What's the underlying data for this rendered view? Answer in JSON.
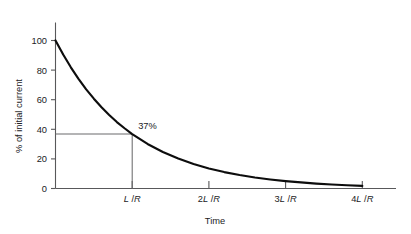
{
  "chart_data": {
    "type": "line",
    "title": "",
    "subtitle": "",
    "xlabel": "Time",
    "ylabel": "% of initial current",
    "xlim": [
      0,
      4.45
    ],
    "ylim": [
      0,
      107
    ],
    "grid": false,
    "legend": null,
    "x_tick_values": [
      1,
      2,
      3,
      4
    ],
    "x_tick_labels": [
      "L /R",
      "2L /R",
      "3L /R",
      "4L /R"
    ],
    "x_ticks": [
      {
        "value": 1,
        "prefix": "",
        "numer": "L",
        "slash": " /",
        "denom": "R"
      },
      {
        "value": 2,
        "prefix": "2",
        "numer": "L",
        "slash": " /",
        "denom": "R"
      },
      {
        "value": 3,
        "prefix": "3",
        "numer": "L",
        "slash": " /",
        "denom": "R"
      },
      {
        "value": 4,
        "prefix": "4",
        "numer": "L",
        "slash": " /",
        "denom": "R"
      }
    ],
    "y_tick_values": [
      0,
      20,
      40,
      60,
      80,
      100
    ],
    "y_tick_labels": [
      "0",
      "20",
      "40",
      "60",
      "80",
      "100"
    ],
    "series": [
      {
        "name": "decaying current",
        "formula": "100 * exp(-t)",
        "x": [
          0,
          0.1,
          0.2,
          0.3,
          0.4,
          0.5,
          0.6,
          0.7,
          0.8,
          0.9,
          1.0,
          1.2,
          1.4,
          1.6,
          1.8,
          2.0,
          2.2,
          2.4,
          2.6,
          2.8,
          3.0,
          3.2,
          3.4,
          3.6,
          3.8,
          4.0
        ],
        "values": [
          100.0,
          90.5,
          81.9,
          74.1,
          67.0,
          60.7,
          54.9,
          49.7,
          44.9,
          40.7,
          36.8,
          30.1,
          24.7,
          20.2,
          16.5,
          13.5,
          11.1,
          9.1,
          7.4,
          6.1,
          5.0,
          4.1,
          3.3,
          2.7,
          2.2,
          1.8
        ]
      }
    ],
    "annotations": [
      {
        "label": "37%",
        "x": 1,
        "y": 36.8,
        "guide_horizontal": true,
        "guide_vertical": true
      }
    ],
    "colors": {
      "curve": "#0d0d0d",
      "axis": "#58585a",
      "guide": "#6b6b6d",
      "text": "#222224",
      "background": "#ffffff"
    }
  }
}
